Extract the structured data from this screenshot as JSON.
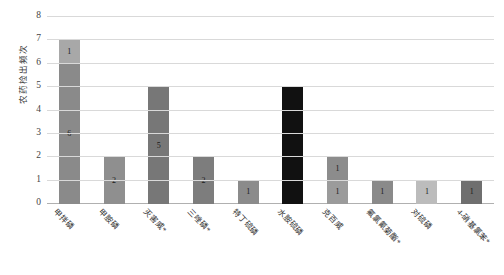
{
  "chart_data": {
    "type": "bar",
    "title": "",
    "subtitle": "",
    "xlabel": "",
    "ylabel": "农药检出频次",
    "ylim": [
      0,
      8
    ],
    "ytick_values": [
      0,
      1,
      2,
      3,
      4,
      5,
      6,
      7,
      8
    ],
    "ytick_labels": [
      "0",
      "1",
      "2",
      "3",
      "4",
      "5",
      "6",
      "7",
      "8"
    ],
    "grid": true,
    "legend": false,
    "legend_position": "none",
    "stacked": true,
    "categories": [
      "甲拌磷",
      "甲胺磷",
      "灭害威*",
      "三唑磷*",
      "特丁硫磷",
      "水胺硫磷",
      "克百威",
      "氟氯氰菊酯*",
      "对硫磷",
      "4-硝基氯苯*"
    ],
    "bars": [
      {
        "category": "甲拌磷",
        "total": 7,
        "segments": [
          {
            "value": 6,
            "label": "6",
            "color": "#8a8a8a"
          },
          {
            "value": 1,
            "label": "1",
            "color": "#a8a8a8"
          }
        ]
      },
      {
        "category": "甲胺磷",
        "total": 2,
        "segments": [
          {
            "value": 2,
            "label": "2",
            "color": "#8f8f8f"
          }
        ]
      },
      {
        "category": "灭害威*",
        "total": 5,
        "segments": [
          {
            "value": 5,
            "label": "5",
            "color": "#777777"
          }
        ]
      },
      {
        "category": "三唑磷*",
        "total": 2,
        "segments": [
          {
            "value": 2,
            "label": "2",
            "color": "#7d7d7d"
          }
        ]
      },
      {
        "category": "特丁硫磷",
        "total": 1,
        "segments": [
          {
            "value": 1,
            "label": "1",
            "color": "#8b8b8b"
          }
        ]
      },
      {
        "category": "水胺硫磷",
        "total": 5,
        "segments": [
          {
            "value": 5,
            "label": "5",
            "color": "#111111"
          }
        ]
      },
      {
        "category": "克百威",
        "total": 2,
        "segments": [
          {
            "value": 1,
            "label": "1",
            "color": "#9b9b9b"
          },
          {
            "value": 1,
            "label": "1",
            "color": "#8c8c8c"
          }
        ]
      },
      {
        "category": "氟氯氰菊酯*",
        "total": 1,
        "segments": [
          {
            "value": 1,
            "label": "1",
            "color": "#8a8a8a"
          }
        ]
      },
      {
        "category": "对硫磷",
        "total": 1,
        "segments": [
          {
            "value": 1,
            "label": "1",
            "color": "#bcbcbc"
          }
        ]
      },
      {
        "category": "4-硝基氯苯*",
        "total": 1,
        "segments": [
          {
            "value": 1,
            "label": "1",
            "color": "#6f6f6f"
          }
        ]
      }
    ],
    "colors": {
      "gridline": "#d9d9d9",
      "axis": "#b0b0b0",
      "tick_text": "#444444",
      "background": "#ffffff"
    }
  }
}
